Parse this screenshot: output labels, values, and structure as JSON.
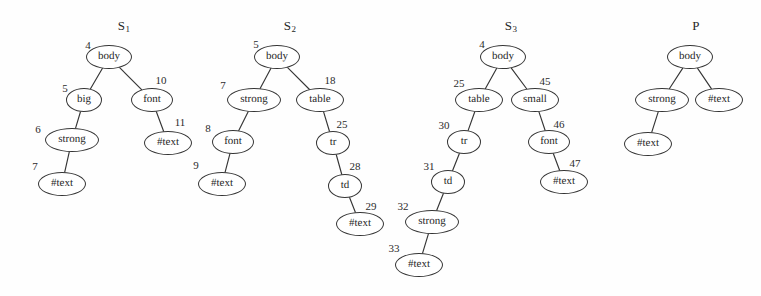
{
  "figure": {
    "kind": "dom-tree-diagram",
    "background_color": "#fefefe",
    "stroke_color": "#353535",
    "text_color": "#1f1f1f",
    "width": 761,
    "height": 296
  },
  "trees": [
    {
      "name": "S1",
      "title_text": "S",
      "title_sub": "1",
      "title_x": 124,
      "title_y": 26,
      "nodes": [
        {
          "id": "4",
          "label": "body",
          "cx": 109,
          "cy": 57,
          "rx": 23,
          "ry": 12,
          "id_x": 88,
          "id_y": 45
        },
        {
          "id": "5",
          "label": "big",
          "cx": 84,
          "cy": 100,
          "rx": 18,
          "ry": 12,
          "id_x": 65,
          "id_y": 88
        },
        {
          "id": "10",
          "label": "font",
          "cx": 152,
          "cy": 100,
          "rx": 21,
          "ry": 12,
          "id_x": 161,
          "id_y": 80
        },
        {
          "id": "6",
          "label": "strong",
          "cx": 72,
          "cy": 140,
          "rx": 27,
          "ry": 12,
          "id_x": 38,
          "id_y": 129
        },
        {
          "id": "11",
          "label": "#text",
          "cx": 168,
          "cy": 143,
          "rx": 24,
          "ry": 12,
          "id_x": 180,
          "id_y": 122
        },
        {
          "id": "7",
          "label": "#text",
          "cx": 62,
          "cy": 184,
          "rx": 24,
          "ry": 12,
          "id_x": 35,
          "id_y": 166
        }
      ],
      "edges": [
        {
          "from": "4",
          "to": "5"
        },
        {
          "from": "4",
          "to": "10"
        },
        {
          "from": "5",
          "to": "6"
        },
        {
          "from": "10",
          "to": "11"
        },
        {
          "from": "6",
          "to": "7"
        }
      ]
    },
    {
      "name": "S2",
      "title_text": "S",
      "title_sub": "2",
      "title_x": 290,
      "title_y": 26,
      "nodes": [
        {
          "id": "5",
          "label": "body",
          "cx": 277,
          "cy": 57,
          "rx": 23,
          "ry": 12,
          "id_x": 256,
          "id_y": 44
        },
        {
          "id": "7",
          "label": "strong",
          "cx": 254,
          "cy": 100,
          "rx": 27,
          "ry": 12,
          "id_x": 223,
          "id_y": 85
        },
        {
          "id": "18",
          "label": "table",
          "cx": 320,
          "cy": 100,
          "rx": 24,
          "ry": 12,
          "id_x": 330,
          "id_y": 80
        },
        {
          "id": "8",
          "label": "font",
          "cx": 233,
          "cy": 142,
          "rx": 21,
          "ry": 12,
          "id_x": 208,
          "id_y": 128
        },
        {
          "id": "25",
          "label": "tr",
          "cx": 333,
          "cy": 143,
          "rx": 17,
          "ry": 12,
          "id_x": 342,
          "id_y": 124
        },
        {
          "id": "9",
          "label": "#text",
          "cx": 222,
          "cy": 184,
          "rx": 24,
          "ry": 12,
          "id_x": 196,
          "id_y": 165
        },
        {
          "id": "28",
          "label": "td",
          "cx": 345,
          "cy": 186,
          "rx": 17,
          "ry": 12,
          "id_x": 355,
          "id_y": 166
        },
        {
          "id": "29",
          "label": "#text",
          "cx": 360,
          "cy": 224,
          "rx": 24,
          "ry": 12,
          "id_x": 371,
          "id_y": 206
        }
      ],
      "edges": [
        {
          "from": "5",
          "to": "7"
        },
        {
          "from": "5",
          "to": "18"
        },
        {
          "from": "7",
          "to": "8"
        },
        {
          "from": "18",
          "to": "25"
        },
        {
          "from": "8",
          "to": "9"
        },
        {
          "from": "25",
          "to": "28"
        },
        {
          "from": "28",
          "to": "29"
        }
      ]
    },
    {
      "name": "S3",
      "title_text": "S",
      "title_sub": "3",
      "title_x": 511,
      "title_y": 26,
      "nodes": [
        {
          "id": "4",
          "label": "body",
          "cx": 503,
          "cy": 57,
          "rx": 23,
          "ry": 12,
          "id_x": 482,
          "id_y": 44
        },
        {
          "id": "25",
          "label": "table",
          "cx": 479,
          "cy": 100,
          "rx": 24,
          "ry": 12,
          "id_x": 459,
          "id_y": 83
        },
        {
          "id": "45",
          "label": "small",
          "cx": 535,
          "cy": 100,
          "rx": 24,
          "ry": 12,
          "id_x": 545,
          "id_y": 81
        },
        {
          "id": "30",
          "label": "tr",
          "cx": 464,
          "cy": 142,
          "rx": 17,
          "ry": 12,
          "id_x": 444,
          "id_y": 125
        },
        {
          "id": "46",
          "label": "font",
          "cx": 549,
          "cy": 142,
          "rx": 21,
          "ry": 12,
          "id_x": 559,
          "id_y": 124
        },
        {
          "id": "31",
          "label": "td",
          "cx": 448,
          "cy": 182,
          "rx": 17,
          "ry": 12,
          "id_x": 429,
          "id_y": 166
        },
        {
          "id": "47",
          "label": "#text",
          "cx": 564,
          "cy": 182,
          "rx": 24,
          "ry": 12,
          "id_x": 575,
          "id_y": 163
        },
        {
          "id": "32",
          "label": "strong",
          "cx": 432,
          "cy": 222,
          "rx": 27,
          "ry": 12,
          "id_x": 403,
          "id_y": 206
        },
        {
          "id": "33",
          "label": "#text",
          "cx": 419,
          "cy": 265,
          "rx": 24,
          "ry": 12,
          "id_x": 394,
          "id_y": 248
        }
      ],
      "edges": [
        {
          "from": "4",
          "to": "25"
        },
        {
          "from": "4",
          "to": "45"
        },
        {
          "from": "25",
          "to": "30"
        },
        {
          "from": "45",
          "to": "46"
        },
        {
          "from": "30",
          "to": "31"
        },
        {
          "from": "46",
          "to": "47"
        },
        {
          "from": "31",
          "to": "32"
        },
        {
          "from": "32",
          "to": "33"
        }
      ]
    },
    {
      "name": "P",
      "title_text": "P",
      "title_sub": "",
      "title_x": 696,
      "title_y": 26,
      "nodes": [
        {
          "id": "p1",
          "label": "body",
          "cx": 690,
          "cy": 57,
          "rx": 23,
          "ry": 12,
          "id_x": 0,
          "id_y": 0
        },
        {
          "id": "p2",
          "label": "strong",
          "cx": 662,
          "cy": 100,
          "rx": 27,
          "ry": 12,
          "id_x": 0,
          "id_y": 0
        },
        {
          "id": "p3",
          "label": "#text",
          "cx": 719,
          "cy": 100,
          "rx": 24,
          "ry": 12,
          "id_x": 0,
          "id_y": 0
        },
        {
          "id": "p4",
          "label": "#text",
          "cx": 648,
          "cy": 144,
          "rx": 24,
          "ry": 12,
          "id_x": 0,
          "id_y": 0
        }
      ],
      "edges": [
        {
          "from": "p1",
          "to": "p2"
        },
        {
          "from": "p1",
          "to": "p3"
        },
        {
          "from": "p2",
          "to": "p4"
        }
      ]
    }
  ]
}
